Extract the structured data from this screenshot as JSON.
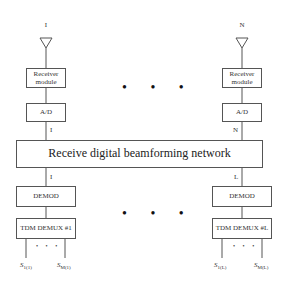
{
  "diagram": {
    "title": "Receive digital beamforming network",
    "left_chain": {
      "antenna_label": "I",
      "receiver_label": "Receiver module",
      "ad_label": "A/D",
      "ad_output_label": "I",
      "beam_output_label": "I",
      "demod_label": "DEMOD",
      "tdm_label": "TDM DEMUX #1",
      "output_first": {
        "symbol": "S",
        "sub": "1",
        "paren": "(1)"
      },
      "output_last": {
        "symbol": "S",
        "sub": "M",
        "paren": "(1)"
      }
    },
    "right_chain": {
      "antenna_label": "N",
      "receiver_label": "Receiver module",
      "ad_label": "A/D",
      "ad_output_label": "N",
      "beam_output_label": "L",
      "demod_label": "DEMOD",
      "tdm_label": "TDM DEMUX #L",
      "output_first": {
        "symbol": "S",
        "sub": "1",
        "paren": "(L)"
      },
      "output_last": {
        "symbol": "S",
        "sub": "M",
        "paren": "(L)"
      }
    },
    "ellipsis_top": "• • •",
    "ellipsis_bottom": "• • •",
    "output_ellipsis": "• • •"
  }
}
